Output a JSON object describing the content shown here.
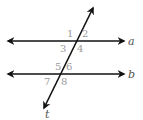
{
  "diagram": {
    "type": "parallel-lines-transversal",
    "colors": {
      "line": "#111111",
      "angle_label": "#9a9a9a",
      "line_label": "#555555",
      "background": "#ffffff"
    },
    "lines": [
      {
        "id": "a",
        "label": "a",
        "y": 41,
        "x1": 8,
        "x2": 124
      },
      {
        "id": "b",
        "label": "b",
        "y": 74,
        "x1": 8,
        "x2": 124
      }
    ],
    "transversal": {
      "label": "t",
      "x1": 44,
      "y1": 108,
      "x2": 93,
      "y2": 8
    },
    "angles": [
      {
        "label": "1",
        "x": 67,
        "y": 37
      },
      {
        "label": "2",
        "x": 82,
        "y": 37
      },
      {
        "label": "3",
        "x": 60,
        "y": 52
      },
      {
        "label": "4",
        "x": 77,
        "y": 52
      },
      {
        "label": "5",
        "x": 55,
        "y": 70
      },
      {
        "label": "6",
        "x": 66,
        "y": 70
      },
      {
        "label": "7",
        "x": 44,
        "y": 85
      },
      {
        "label": "8",
        "x": 61,
        "y": 85
      }
    ]
  }
}
